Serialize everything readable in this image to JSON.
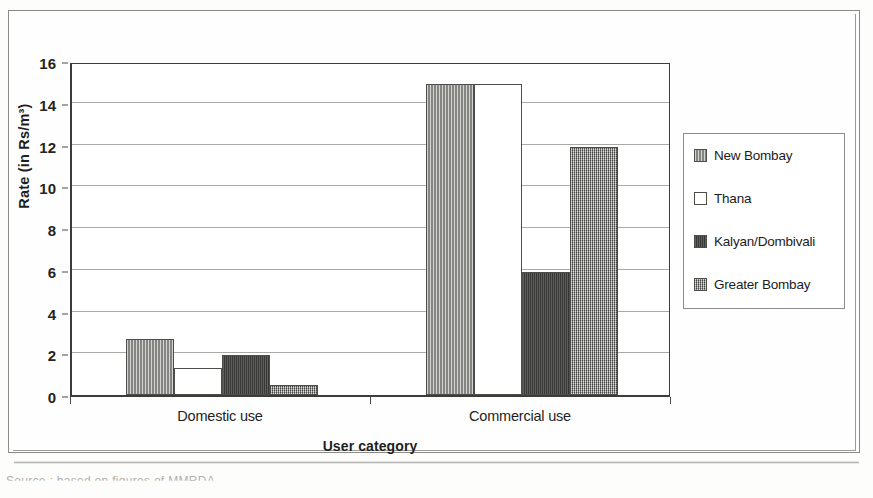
{
  "chart_data": {
    "type": "bar",
    "title": "",
    "xlabel": "User category",
    "ylabel": "Rate (in Rs/m³)",
    "categories": [
      "Domestic use",
      "Commercial use"
    ],
    "ylim": [
      0,
      16
    ],
    "yticks": [
      0,
      2,
      4,
      6,
      8,
      10,
      12,
      14,
      16
    ],
    "grid": true,
    "legend_position": "right",
    "series": [
      {
        "name": "New Bombay",
        "values": [
          2.7,
          14.9
        ],
        "swatch": "#9c9c99",
        "pattern": "vertical-stripe"
      },
      {
        "name": "Thana",
        "values": [
          1.3,
          14.9
        ],
        "swatch": "#ffffff",
        "pattern": "solid-white"
      },
      {
        "name": "Kalyan/Dombivali",
        "values": [
          1.9,
          5.9
        ],
        "swatch": "#4a4a48",
        "pattern": "dark-solid"
      },
      {
        "name": "Greater Bombay",
        "values": [
          0.5,
          11.9
        ],
        "swatch": "#7e7e7b",
        "pattern": "cross-hatch"
      }
    ]
  },
  "page": {
    "caption_fragment": "Source : based on figures of MMRDA"
  }
}
